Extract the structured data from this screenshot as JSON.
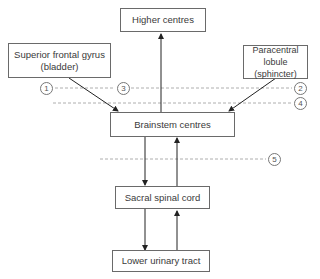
{
  "diagram": {
    "nodes": {
      "higher_centres": "Higher centres",
      "superior_frontal_gyrus": {
        "line1": "Superior frontal gyrus",
        "line2": "(bladder)"
      },
      "paracentral_lobule": {
        "line1": "Paracentral lobule",
        "line2": "(sphincter)"
      },
      "brainstem_centres": "Brainstem centres",
      "sacral_spinal_cord": "Sacral spinal cord",
      "lower_urinary_tract": "Lower urinary tract"
    },
    "markers": [
      "1",
      "2",
      "3",
      "4",
      "5"
    ],
    "edges": [
      {
        "from": "Brainstem centres",
        "to": "Higher centres"
      },
      {
        "from": "Superior frontal gyrus (bladder)",
        "to": "Brainstem centres"
      },
      {
        "from": "Paracentral lobule (sphincter)",
        "to": "Brainstem centres"
      },
      {
        "from": "Brainstem centres",
        "to": "Sacral spinal cord"
      },
      {
        "from": "Sacral spinal cord",
        "to": "Brainstem centres"
      },
      {
        "from": "Sacral spinal cord",
        "to": "Lower urinary tract"
      },
      {
        "from": "Lower urinary tract",
        "to": "Sacral spinal cord"
      }
    ],
    "colors": {
      "line": "#222222",
      "dotted": "#9a9a9a",
      "border": "#6a6a6a"
    }
  }
}
